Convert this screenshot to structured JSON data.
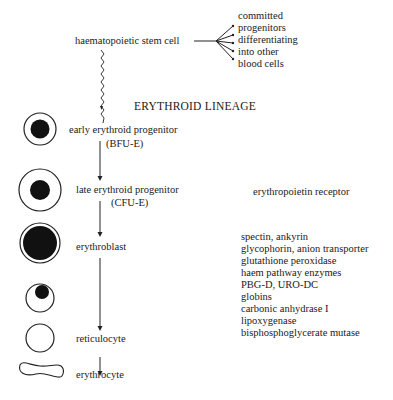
{
  "diagram": {
    "title": "ERYTHROID LINEAGE",
    "stem_cell": {
      "label": "haematopoietic stem cell",
      "branch_text": [
        "committed",
        "progenitors",
        "differentiating",
        "into other",
        "blood cells"
      ]
    },
    "stages": [
      {
        "label": "early erythroid progenitor",
        "sublabel": "(BFU-E)"
      },
      {
        "label": "late erythroid progenitor",
        "sublabel": "(CFU-E)"
      },
      {
        "label": "erythroblast",
        "sublabel": ""
      },
      {
        "label": "reticulocyte",
        "sublabel": ""
      },
      {
        "label": "erythrocyte",
        "sublabel": ""
      }
    ],
    "markers": {
      "receptor": "erythropoietin receptor",
      "proteins": [
        "spectin, ankyrin",
        "glycophorin, anion transporter",
        "glutathione peroxidase",
        "haem pathway enzymes",
        "PBG-D, URO-DC",
        "globins",
        "carbonic anhydrase I",
        "lipoxygenase",
        "bisphosphoglycerate mutase"
      ]
    }
  }
}
